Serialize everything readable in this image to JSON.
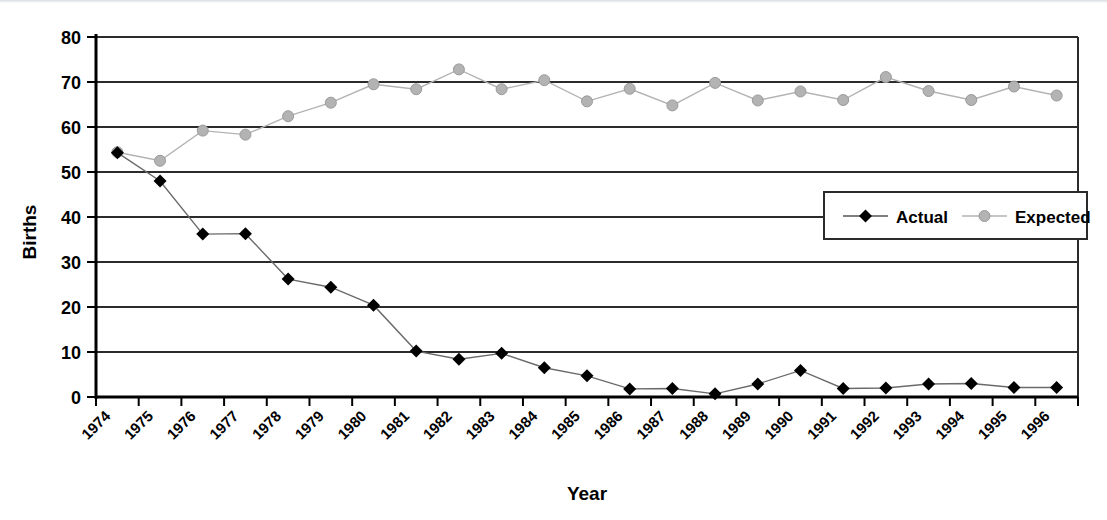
{
  "chart_data": {
    "type": "line",
    "title": "",
    "xlabel": "Year",
    "ylabel": "Births",
    "x": [
      1974,
      1975,
      1976,
      1977,
      1978,
      1979,
      1980,
      1981,
      1982,
      1983,
      1984,
      1985,
      1986,
      1987,
      1988,
      1989,
      1990,
      1991,
      1992,
      1993,
      1994,
      1995,
      1996
    ],
    "categories": [
      "1974",
      "1975",
      "1976",
      "1977",
      "1978",
      "1979",
      "1980",
      "1981",
      "1982",
      "1983",
      "1984",
      "1985",
      "1986",
      "1987",
      "1988",
      "1989",
      "1990",
      "1991",
      "1992",
      "1993",
      "1994",
      "1995",
      "1996"
    ],
    "series": [
      {
        "name": "Actual",
        "color": "#000000",
        "marker": "diamond",
        "values": [
          54.3,
          48.0,
          36.2,
          36.3,
          26.2,
          24.4,
          20.4,
          10.2,
          8.4,
          9.7,
          6.5,
          4.7,
          1.8,
          1.9,
          0.7,
          2.9,
          5.9,
          1.9,
          2.0,
          2.9,
          3.0,
          2.1,
          2.1
        ]
      },
      {
        "name": "Expected",
        "color": "#b3b3b3",
        "marker": "circle",
        "values": [
          54.4,
          52.5,
          59.2,
          58.3,
          62.4,
          65.4,
          69.5,
          68.4,
          72.8,
          68.4,
          70.4,
          65.7,
          68.5,
          64.8,
          69.8,
          65.9,
          67.9,
          66.0,
          71.1,
          68.0,
          66.0,
          69.0,
          67.0
        ]
      }
    ],
    "ylim": [
      0,
      80
    ],
    "yticks": [
      0,
      10,
      20,
      30,
      40,
      50,
      60,
      70,
      80
    ],
    "ytick_labels": [
      "0",
      "10",
      "20",
      "30",
      "40",
      "50",
      "60",
      "70",
      "80"
    ],
    "grid": "horizontal",
    "legend_position": "inside-right",
    "xtick_rotation": 45
  },
  "legend": {
    "entries": [
      {
        "label": "Actual",
        "color": "#000000",
        "marker": "diamond"
      },
      {
        "label": "Expected",
        "color": "#b3b3b3",
        "marker": "circle"
      }
    ]
  },
  "axes": {
    "y_title": "Births",
    "x_title": "Year"
  },
  "colors": {
    "actual": "#000000",
    "expected": "#b3b3b3",
    "gridline": "#2b2b2b",
    "axis": "#000000",
    "background": "#ffffff"
  }
}
